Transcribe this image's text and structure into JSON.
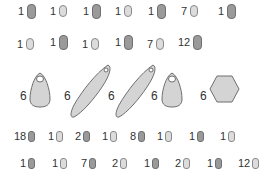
{
  "bead_rows": [
    {
      "name": "row-1",
      "items": [
        {
          "count": "1",
          "tone": "dark",
          "size": "large"
        },
        {
          "count": "1",
          "tone": "light",
          "size": "med"
        },
        {
          "count": "1",
          "tone": "dark",
          "size": "large"
        },
        {
          "count": "1",
          "tone": "light",
          "size": "med"
        },
        {
          "count": "1",
          "tone": "dark",
          "size": "large"
        },
        {
          "count": "7",
          "tone": "light",
          "size": "med"
        },
        {
          "count": "1",
          "tone": "dark",
          "size": "large"
        }
      ]
    },
    {
      "name": "row-2",
      "items": [
        {
          "count": "1",
          "tone": "light",
          "size": "med"
        },
        {
          "count": "1",
          "tone": "dark",
          "size": "large"
        },
        {
          "count": "1",
          "tone": "light",
          "size": "med"
        },
        {
          "count": "1",
          "tone": "dark",
          "size": "large"
        },
        {
          "count": "7",
          "tone": "light",
          "size": "med"
        },
        {
          "count": "12",
          "tone": "dark",
          "size": "large"
        }
      ]
    },
    {
      "name": "row-3",
      "items": [
        {
          "count": "18",
          "tone": "dark",
          "size": "small"
        },
        {
          "count": "1",
          "tone": "light",
          "size": "small"
        },
        {
          "count": "2",
          "tone": "dark",
          "size": "small"
        },
        {
          "count": "1",
          "tone": "light",
          "size": "small"
        },
        {
          "count": "8",
          "tone": "dark",
          "size": "small"
        },
        {
          "count": "1",
          "tone": "light",
          "size": "small"
        },
        {
          "count": "1",
          "tone": "dark",
          "size": "small"
        },
        {
          "count": "1",
          "tone": "light",
          "size": "small"
        }
      ]
    },
    {
      "name": "row-4",
      "items": [
        {
          "count": "1",
          "tone": "dark",
          "size": "small"
        },
        {
          "count": "1",
          "tone": "light",
          "size": "small"
        },
        {
          "count": "7",
          "tone": "dark",
          "size": "small"
        },
        {
          "count": "2",
          "tone": "light",
          "size": "small"
        },
        {
          "count": "1",
          "tone": "dark",
          "size": "small"
        },
        {
          "count": "2",
          "tone": "light",
          "size": "small"
        },
        {
          "count": "1",
          "tone": "dark",
          "size": "small"
        },
        {
          "count": "12",
          "tone": "light",
          "size": "small"
        }
      ]
    }
  ],
  "pendants": [
    {
      "count": "6",
      "shape": "drop"
    },
    {
      "count": "6",
      "shape": "long-leaf"
    },
    {
      "count": "6",
      "shape": "long-leaf"
    },
    {
      "count": "6",
      "shape": "drop"
    },
    {
      "count": "6",
      "shape": "hexagon"
    }
  ],
  "colors": {
    "dark_bead": "#9a9a9a",
    "light_bead": "#dcdcdc",
    "pendant_fill": "#d4d4d4",
    "outline": "#6f6f6f",
    "text": "#333333"
  }
}
